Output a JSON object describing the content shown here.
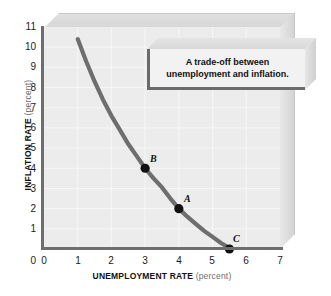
{
  "chart_data": {
    "type": "line",
    "title": "",
    "xlabel": "UNEMPLOYMENT RATE",
    "xlabel_unit": "(percent)",
    "ylabel": "INFLATION RATE",
    "ylabel_unit": "(percent)",
    "xlim": [
      0,
      7
    ],
    "ylim": [
      0,
      11
    ],
    "xticks": [
      "0",
      "1",
      "2",
      "3",
      "4",
      "5",
      "6",
      "7"
    ],
    "yticks": [
      "0",
      "1",
      "2",
      "3",
      "4",
      "5",
      "6",
      "7",
      "8",
      "9",
      "10",
      "11"
    ],
    "grid": true,
    "legend": "none",
    "series": [
      {
        "name": "Phillips curve",
        "color": "#6e6e6e",
        "x": [
          1.0,
          1.25,
          1.5,
          1.75,
          2.0,
          2.25,
          2.5,
          2.75,
          3.0,
          3.25,
          3.5,
          3.75,
          4.0,
          4.25,
          4.5,
          4.75,
          5.0,
          5.25,
          5.5
        ],
        "y": [
          10.4,
          9.3,
          8.3,
          7.4,
          6.6,
          5.9,
          5.2,
          4.6,
          4.0,
          3.5,
          3.05,
          2.5,
          2.0,
          1.6,
          1.25,
          0.9,
          0.6,
          0.3,
          0.05
        ]
      }
    ],
    "points": [
      {
        "label": "B",
        "x": 3.0,
        "y": 4.0
      },
      {
        "label": "A",
        "x": 4.0,
        "y": 2.0
      },
      {
        "label": "C",
        "x": 5.5,
        "y": 0.0
      }
    ],
    "annotations": [
      {
        "name": "callout",
        "line1": "A trade-off between",
        "line2": "unemployment and inflation."
      }
    ]
  },
  "callout": {
    "line1": "A trade-off between",
    "line2": "unemployment and inflation."
  },
  "axes": {
    "x_title": "UNEMPLOYMENT RATE",
    "x_unit": "(percent)",
    "y_title": "INFLATION RATE",
    "y_unit": "(percent)"
  },
  "colors": {
    "curve": "#6e6e6e",
    "axis": "#6e6e6e",
    "plot_bg": "#ececec",
    "gridline": "#f7f7f7",
    "point": "#111111",
    "page_bg": "#ffffff"
  }
}
